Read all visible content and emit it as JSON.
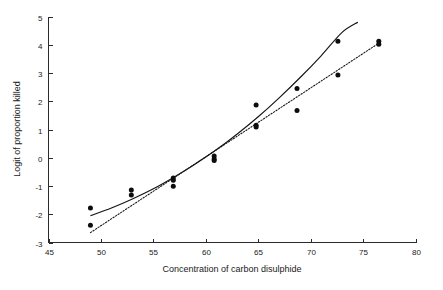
{
  "chart_data": {
    "type": "scatter",
    "title": "",
    "xlabel": "Concentration of carbon disulphide",
    "ylabel": "Logit of proportion killed",
    "xlim": [
      45,
      80
    ],
    "ylim": [
      -3,
      5
    ],
    "xticks": [
      45,
      50,
      55,
      60,
      65,
      70,
      75,
      80
    ],
    "yticks": [
      -3,
      -2,
      -1,
      0,
      1,
      2,
      3,
      4,
      5
    ],
    "xtick_labels": [
      "45",
      "50",
      "55",
      "60",
      "65",
      "70",
      "75",
      "80"
    ],
    "ytick_labels": [
      "-3",
      "-2",
      "-1",
      "0",
      "1",
      "2",
      "3",
      "4",
      "5"
    ],
    "grid": false,
    "legend": "none",
    "marker": "filled-circle",
    "points": [
      {
        "x": 49.0,
        "y": -1.78
      },
      {
        "x": 49.0,
        "y": -2.39
      },
      {
        "x": 52.9,
        "y": -1.14
      },
      {
        "x": 52.9,
        "y": -1.32
      },
      {
        "x": 56.9,
        "y": -0.72
      },
      {
        "x": 56.9,
        "y": -0.8
      },
      {
        "x": 56.9,
        "y": -1.01
      },
      {
        "x": 60.8,
        "y": 0.06
      },
      {
        "x": 60.8,
        "y": -0.04
      },
      {
        "x": 60.8,
        "y": -0.1
      },
      {
        "x": 64.8,
        "y": 1.87
      },
      {
        "x": 64.8,
        "y": 1.15
      },
      {
        "x": 64.8,
        "y": 1.09
      },
      {
        "x": 68.7,
        "y": 2.45
      },
      {
        "x": 68.7,
        "y": 1.67
      },
      {
        "x": 72.6,
        "y": 4.12
      },
      {
        "x": 72.6,
        "y": 2.93
      },
      {
        "x": 76.5,
        "y": 4.12
      },
      {
        "x": 76.5,
        "y": 4.02
      }
    ],
    "series": [
      {
        "name": "solid-fit",
        "style": "solid",
        "x": [
          49.0,
          51.0,
          53.0,
          55.0,
          57.0,
          59.0,
          61.0,
          63.0,
          65.0,
          67.0,
          69.0,
          71.0,
          73.0,
          74.5
        ],
        "y": [
          -2.05,
          -1.78,
          -1.46,
          -1.1,
          -0.68,
          -0.22,
          0.28,
          0.84,
          1.45,
          2.12,
          2.84,
          3.61,
          4.44,
          4.8
        ]
      },
      {
        "name": "dotted-fit",
        "style": "dotted",
        "x": [
          49.0,
          76.6
        ],
        "y": [
          -2.65,
          4.08
        ]
      }
    ]
  },
  "axes": {
    "x_title": "Concentration of carbon disulphide",
    "y_title": "Logit of proportion killed"
  }
}
